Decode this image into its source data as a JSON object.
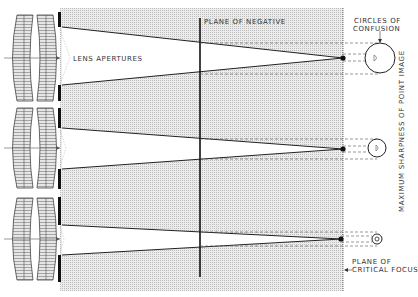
{
  "labels": {
    "lens_apertures": "LENS APERTURES",
    "plane_of_negative": "PLANE OF NEGATIVE",
    "circles_of_confusion_line1": "CIRCLES OF",
    "circles_of_confusion_line2": "CONFUSION",
    "maximum_sharpness": "MAXIMUM SHARPNESS OF POINT IMAGE",
    "plane_of_critical_focus_line1": "PLANE OF",
    "plane_of_critical_focus_line2": "CRITICAL FOCUS"
  },
  "diagram": {
    "type": "optics",
    "lens_systems": [
      {
        "aperture": "wide",
        "axis_y": 58,
        "circle_size": "large"
      },
      {
        "aperture": "medium",
        "axis_y": 148,
        "circle_size": "medium"
      },
      {
        "aperture": "small",
        "axis_y": 239,
        "circle_size": "small"
      }
    ],
    "colors": {
      "shading": "#d8d8d8",
      "lines": "#222222",
      "background": "#ffffff"
    }
  }
}
